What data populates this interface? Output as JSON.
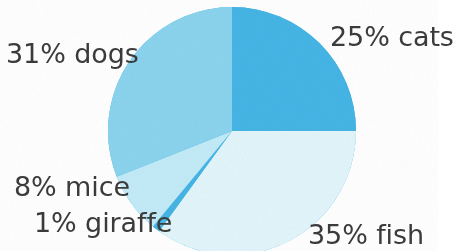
{
  "chart_data": {
    "type": "pie",
    "title": "",
    "subtitle": "",
    "xlabel": "",
    "ylabel": "",
    "legend_position": "none",
    "grid": false,
    "units": "percent",
    "total": 100,
    "start_angle_deg": 0,
    "direction": "clockwise",
    "categories": [
      "cats",
      "fish",
      "giraffe",
      "mice",
      "dogs"
    ],
    "values": [
      25,
      35,
      1,
      8,
      31
    ],
    "labels": [
      "25% cats",
      "35% fish",
      "1% giraffe",
      "8% mice",
      "31% dogs"
    ],
    "slices": [
      {
        "name": "cats",
        "label": "25% cats",
        "value": 25,
        "percent": "25%",
        "color": "#45b5e5",
        "start_deg": 0,
        "end_deg": 90
      },
      {
        "name": "fish",
        "label": "35% fish",
        "value": 35,
        "percent": "35%",
        "color": "#e2f5fb",
        "start_deg": 90,
        "end_deg": 216
      },
      {
        "name": "giraffe",
        "label": "1% giraffe",
        "value": 1,
        "percent": "1%",
        "color": "#45b5e5",
        "start_deg": 216,
        "end_deg": 219.6
      },
      {
        "name": "mice",
        "label": "8% mice",
        "value": 8,
        "percent": "8%",
        "color": "#c3ebf7",
        "start_deg": 219.6,
        "end_deg": 248.4
      },
      {
        "name": "dogs",
        "label": "31% dogs",
        "value": 31,
        "percent": "31%",
        "color": "#8bd4ee",
        "start_deg": 248.4,
        "end_deg": 360
      }
    ],
    "geometry": {
      "center_x": 232,
      "center_y": 131,
      "radius": 124
    },
    "text_color": "#3b3b3b",
    "background": "#ffffff"
  },
  "labels": {
    "cats": "25% cats",
    "dogs": "31% dogs",
    "mice": "8% mice",
    "giraffe": "1% giraffe",
    "fish": "35% fish"
  }
}
